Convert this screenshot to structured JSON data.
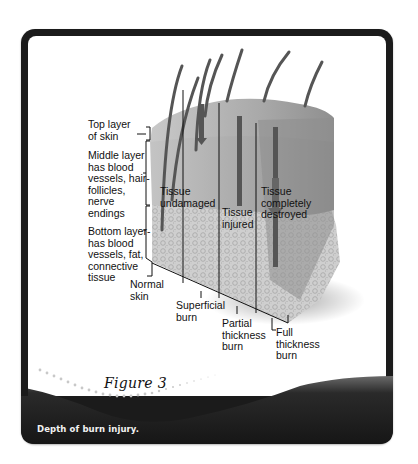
{
  "figure": {
    "title": "Figure 3",
    "caption": "Depth of burn injury."
  },
  "layers": {
    "top": "Top layer\nof skin",
    "middle": "Middle layer\nhas blood\nvessels, hair-\nfollicles,\nnerve\nendings",
    "bottom": "Bottom layer-\nhas blood\nvessels, fat,\nconnective\ntissue"
  },
  "tissue_states": {
    "undamaged": "Tissue\nundamaged",
    "injured": "Tissue\ninjured",
    "destroyed": "Tissue\ncompletely\ndestroyed"
  },
  "burn_types": {
    "normal": "Normal\nskin",
    "superficial": "Superficial\nburn",
    "partial": "Partial\nthickness\nburn",
    "full": "Full\nthickness\nburn"
  },
  "colors": {
    "frame": "#1b1b1b",
    "panel": "#ffffff",
    "skin_top": "#b9b9b9",
    "skin_mid": "#a6a6a6",
    "skin_bottom": "#c8c8c8",
    "text": "#111111",
    "caption_text": "#f2f2f2"
  }
}
